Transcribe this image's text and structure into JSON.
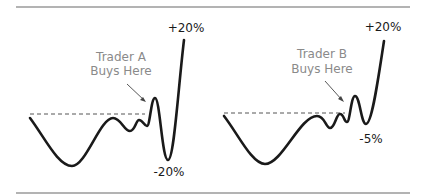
{
  "panels": [
    {
      "id": "trader-a",
      "annotation_line1": "Trader A",
      "annotation_line2": "Buys Here",
      "top_label": "+20%",
      "bottom_label": "-20%"
    },
    {
      "id": "trader-b",
      "annotation_line1": "Trader B",
      "annotation_line2": "Buys Here",
      "top_label": "+20%",
      "bottom_label": "-5%"
    }
  ],
  "colors": {
    "line": "#1a1a1a",
    "annotation": "#8a8a8a",
    "rule": "#9a9a9a",
    "dashed": "#555555"
  }
}
